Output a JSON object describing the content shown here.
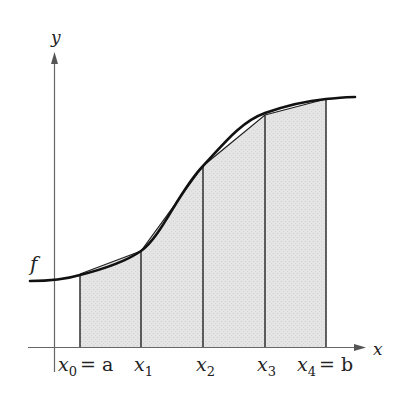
{
  "figure": {
    "colors": {
      "background": "#ffffff",
      "shade": "#e2e2e2",
      "curve": "#111111",
      "axis": "#555555",
      "lines": "#222222"
    },
    "axes": {
      "x_label": "x",
      "y_label": "y"
    },
    "curve": {
      "label": "f"
    },
    "partition": [
      {
        "name": "x0",
        "base": "x",
        "sub": "0",
        "suffix": "= a"
      },
      {
        "name": "x1",
        "base": "x",
        "sub": "1",
        "suffix": ""
      },
      {
        "name": "x2",
        "base": "x",
        "sub": "2",
        "suffix": ""
      },
      {
        "name": "x3",
        "base": "x",
        "sub": "3",
        "suffix": ""
      },
      {
        "name": "x4",
        "base": "x",
        "sub": "4",
        "suffix": "= b"
      }
    ],
    "endpoints": {
      "a": "a",
      "b": "b"
    },
    "subintervals": 4
  }
}
